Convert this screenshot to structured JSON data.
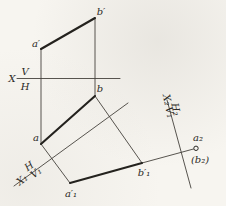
{
  "figure": {
    "width": 226,
    "height": 206,
    "bg_color": "#f7f5f0",
    "thin_color": "#45423c",
    "thick_color": "#24221e",
    "label_color": "#2b2925",
    "label_font_size": 10
  },
  "diagram": {
    "thin_lines": [
      {
        "name": "axis-x-vh",
        "x1": 17,
        "y1": 78.5,
        "x2": 120,
        "y2": 78.5
      },
      {
        "name": "projector-aprime-a",
        "x1": 41,
        "y1": 49,
        "x2": 41,
        "y2": 144
      },
      {
        "name": "projector-bprime-b",
        "x1": 95,
        "y1": 18,
        "x2": 95,
        "y2": 96
      },
      {
        "name": "axis-x1-v1",
        "x1": 14,
        "y1": 186,
        "x2": 128,
        "y2": 103
      },
      {
        "name": "projector-a-a1",
        "x1": 41,
        "y1": 144,
        "x2": 70,
        "y2": 183
      },
      {
        "name": "projector-b-b1",
        "x1": 95,
        "y1": 96,
        "x2": 142,
        "y2": 163
      },
      {
        "name": "extension-b1-a2",
        "x1": 142,
        "y1": 163,
        "x2": 193.5,
        "y2": 149
      },
      {
        "name": "axis-x2-h2",
        "x1": 167,
        "y1": 100,
        "x2": 191,
        "y2": 188
      }
    ],
    "thick_lines": [
      {
        "name": "segment-aprime-bprime",
        "x1": 41,
        "y1": 49,
        "x2": 95,
        "y2": 18
      },
      {
        "name": "segment-a-b",
        "x1": 41,
        "y1": 144,
        "x2": 95,
        "y2": 96
      },
      {
        "name": "segment-a1-b1",
        "x1": 70,
        "y1": 183,
        "x2": 142,
        "y2": 163
      }
    ],
    "markers": [
      {
        "name": "point-a2-circle",
        "cx": 196,
        "cy": 148.3,
        "r": 2.2
      }
    ],
    "labels": [
      {
        "name": "label-a-prime",
        "text": "a′",
        "x": 36,
        "y": 47,
        "rotate": 0,
        "anchor": "middle"
      },
      {
        "name": "label-b-prime",
        "text": "b′",
        "x": 101,
        "y": 15,
        "rotate": 0,
        "anchor": "middle"
      },
      {
        "name": "label-a",
        "text": "a",
        "x": 36,
        "y": 141,
        "rotate": 0,
        "anchor": "middle"
      },
      {
        "name": "label-b",
        "text": "b",
        "x": 100,
        "y": 92,
        "rotate": 0,
        "anchor": "middle"
      },
      {
        "name": "label-a1-prime",
        "text": "a′₁",
        "x": 71,
        "y": 197,
        "rotate": 0,
        "anchor": "middle"
      },
      {
        "name": "label-b1-prime",
        "text": "b′₁",
        "x": 144,
        "y": 176,
        "rotate": 0,
        "anchor": "middle"
      },
      {
        "name": "label-a2",
        "text": "a₂",
        "x": 198,
        "y": 141,
        "rotate": 0,
        "anchor": "middle"
      },
      {
        "name": "label-b2-paren",
        "text": "(b₂)",
        "x": 200,
        "y": 163,
        "rotate": 0,
        "anchor": "middle"
      },
      {
        "name": "label-axis-x",
        "text": "X",
        "x": 12,
        "y": 82,
        "rotate": 0,
        "anchor": "middle"
      },
      {
        "name": "label-axis-v",
        "text": "V",
        "x": 25,
        "y": 74.5,
        "rotate": 0,
        "anchor": "middle"
      },
      {
        "name": "label-axis-h",
        "text": "H",
        "x": 25,
        "y": 90,
        "rotate": 0,
        "anchor": "middle"
      },
      {
        "name": "label-h-above-x1",
        "text": "H",
        "x": 31,
        "y": 169,
        "rotate": -36,
        "anchor": "middle"
      },
      {
        "name": "label-x1",
        "text": "X₁",
        "x": 24,
        "y": 182.5,
        "rotate": -36,
        "anchor": "middle"
      },
      {
        "name": "label-v1-below-x1",
        "text": "V₁",
        "x": 38,
        "y": 175.5,
        "rotate": -36,
        "anchor": "middle"
      },
      {
        "name": "label-x2",
        "text": "X₂",
        "x": 164,
        "y": 100.5,
        "rotate": 78,
        "anchor": "middle"
      },
      {
        "name": "label-v1-left-x2",
        "text": "V₁",
        "x": 166.5,
        "y": 113,
        "rotate": 78,
        "anchor": "middle"
      },
      {
        "name": "label-h2",
        "text": "H₂",
        "x": 172.5,
        "y": 110,
        "rotate": 78,
        "anchor": "middle"
      }
    ]
  }
}
